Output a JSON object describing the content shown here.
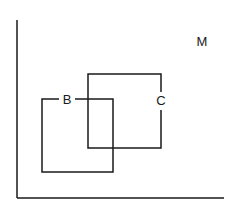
{
  "diagram": {
    "type": "venn-rectangles",
    "universe": {
      "label": "M"
    },
    "sets": [
      {
        "id": "B",
        "label": "B"
      },
      {
        "id": "C",
        "label": "C"
      }
    ],
    "axes": {
      "vertical": true,
      "horizontal": true
    },
    "stroke_color": "#1a1a1a",
    "background": "#ffffff"
  }
}
